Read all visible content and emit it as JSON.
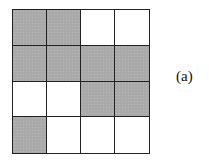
{
  "figure": {
    "label": "(a)",
    "grid": {
      "rows": 4,
      "cols": 4,
      "shaded_color": "#a9a9a9",
      "empty_color": "#ffffff",
      "line_color": "#222222",
      "cells": [
        [
          1,
          1,
          0,
          0
        ],
        [
          1,
          1,
          1,
          1
        ],
        [
          0,
          0,
          1,
          1
        ],
        [
          1,
          0,
          0,
          0
        ]
      ]
    }
  }
}
